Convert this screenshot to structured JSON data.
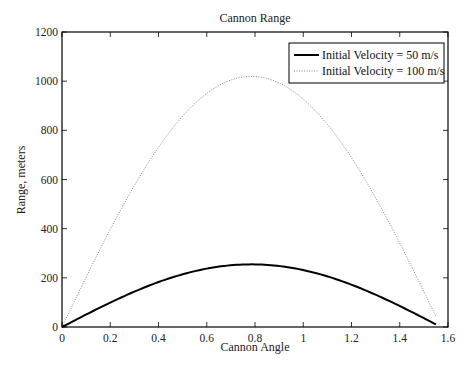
{
  "chart_data": {
    "type": "line",
    "title": "Cannon Range",
    "xlabel": "Cannon Angle",
    "ylabel": "Range, meters",
    "xlim": [
      0,
      1.6
    ],
    "ylim": [
      0,
      1200
    ],
    "xticks": [
      0,
      0.2,
      0.4,
      0.6,
      0.8,
      1,
      1.2,
      1.4,
      1.6
    ],
    "xtick_labels": [
      "0",
      "0.2",
      "0.4",
      "0.6",
      "0.8",
      "1",
      "1.2",
      "1.4",
      "1.6"
    ],
    "yticks": [
      0,
      200,
      400,
      600,
      800,
      1000,
      1200
    ],
    "ytick_labels": [
      "0",
      "200",
      "400",
      "600",
      "800",
      "1000",
      "1200"
    ],
    "grid": false,
    "legend_position": "upper right",
    "x": [
      0,
      0.1,
      0.2,
      0.3,
      0.4,
      0.5,
      0.6,
      0.7,
      0.785,
      0.9,
      1.0,
      1.1,
      1.2,
      1.3,
      1.4,
      1.5,
      1.55
    ],
    "series": [
      {
        "name": "Initial Velocity = 50 m/s",
        "style": "solid",
        "color": "#000000",
        "values": [
          0,
          50.6,
          99.3,
          144.1,
          183.3,
          214.5,
          237.4,
          251.0,
          254.8,
          248.8,
          231.7,
          205.0,
          171.0,
          131.6,
          85.8,
          35.9,
          10.2
        ]
      },
      {
        "name": "Initial Velocity = 100 m/s",
        "style": "dotted",
        "color": "#888888",
        "values": [
          0,
          202.5,
          397.1,
          576.5,
          733.3,
          857.8,
          949.4,
          1004.0,
          1019.4,
          995.4,
          926.9,
          820.0,
          684.2,
          526.3,
          343.3,
          143.6,
          40.8
        ]
      }
    ]
  }
}
